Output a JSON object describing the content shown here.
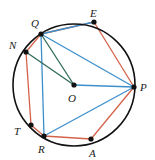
{
  "figure": {
    "colors": {
      "circle": "#111111",
      "red": "#d4624a",
      "blue": "#3d8fcc",
      "green": "#2f6b55",
      "point": "#111111",
      "label": "#1a1a1a",
      "background": "#ffffff"
    },
    "circle": {
      "cx": 74,
      "cy": 85,
      "r": 61,
      "stroke_width": 1.6
    },
    "points": [
      {
        "id": "Q",
        "label": "Q",
        "cx": 41,
        "cy": 34,
        "lx": 31,
        "ly": 18
      },
      {
        "id": "E",
        "label": "E",
        "cx": 94,
        "cy": 22,
        "lx": 90,
        "ly": 8
      },
      {
        "id": "N",
        "label": "N",
        "cx": 26,
        "cy": 52,
        "lx": 9,
        "ly": 40
      },
      {
        "id": "P",
        "label": "P",
        "cx": 134,
        "cy": 87,
        "lx": 140,
        "ly": 82
      },
      {
        "id": "T",
        "label": "T",
        "cx": 31,
        "cy": 125,
        "lx": 14,
        "ly": 126
      },
      {
        "id": "R",
        "label": "R",
        "cx": 44,
        "cy": 136,
        "lx": 38,
        "ly": 144
      },
      {
        "id": "A",
        "label": "A",
        "cx": 91,
        "cy": 139,
        "lx": 89,
        "ly": 148
      },
      {
        "id": "O",
        "label": "O",
        "cx": 74,
        "cy": 85,
        "lx": 68,
        "ly": 93
      }
    ],
    "segments": [
      {
        "id": "seg-N-Q",
        "from": "N",
        "to": "Q",
        "color": "red"
      },
      {
        "id": "seg-Q-E",
        "from": "Q",
        "to": "E",
        "color": "red"
      },
      {
        "id": "seg-E-P",
        "from": "E",
        "to": "P",
        "color": "red"
      },
      {
        "id": "seg-P-A",
        "from": "P",
        "to": "A",
        "color": "red"
      },
      {
        "id": "seg-A-R",
        "from": "A",
        "to": "R",
        "color": "red"
      },
      {
        "id": "seg-R-T",
        "from": "R",
        "to": "T",
        "color": "red"
      },
      {
        "id": "seg-T-N",
        "from": "T",
        "to": "N",
        "color": "red"
      },
      {
        "id": "seg-Q-E-chord",
        "from": "Q",
        "to": "E",
        "color": "blue"
      },
      {
        "id": "seg-Q-P",
        "from": "Q",
        "to": "P",
        "color": "blue"
      },
      {
        "id": "seg-Q-R",
        "from": "Q",
        "to": "R",
        "color": "blue"
      },
      {
        "id": "seg-O-P",
        "from": "O",
        "to": "P",
        "color": "blue"
      },
      {
        "id": "seg-R-P",
        "from": "R",
        "to": "P",
        "color": "blue"
      },
      {
        "id": "seg-Q-O",
        "from": "Q",
        "to": "O",
        "color": "green"
      },
      {
        "id": "seg-N-O",
        "from": "N",
        "to": "O",
        "color": "green"
      }
    ]
  }
}
